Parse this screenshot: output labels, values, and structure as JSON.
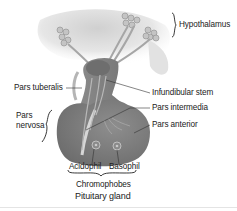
{
  "diagram": {
    "title": "Pituitary gland",
    "labels": {
      "hypothalamus": "Hypothalamus",
      "pars_tuberalis": "Pars tuberalis",
      "infundibular_stem": "Infundibular stem",
      "pars_nervosa": "Pars\nnervosa",
      "pars_nervosa_line1": "Pars",
      "pars_nervosa_line2": "nervosa",
      "pars_intermedia": "Pars intermedia",
      "pars_anterior": "Pars anterior",
      "acidophil": "Acidophil",
      "basophil": "Basophil",
      "chromophobes": "Chromophobes"
    },
    "colors": {
      "background": "#ffffff",
      "tissue_dark": "#7a7a7a",
      "tissue_mid": "#9a9a9a",
      "tissue_light": "#d8d8d8",
      "leader_line": "#333333",
      "text": "#222222"
    }
  }
}
